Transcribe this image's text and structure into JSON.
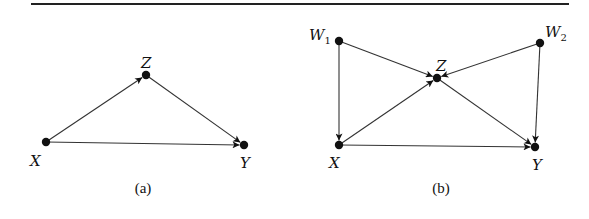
{
  "figure": {
    "rule": {
      "x1": 31,
      "x2": 569,
      "y": 4,
      "color": "#222222"
    },
    "panels": [
      {
        "id": "a",
        "caption": "(a)",
        "caption_pos": [
          143,
          193
        ],
        "nodes": [
          {
            "id": "X",
            "label": "X",
            "sub": "",
            "x": 46,
            "y": 142,
            "lx": 30,
            "ly": 166
          },
          {
            "id": "Z",
            "label": "Z",
            "sub": "",
            "x": 146,
            "y": 75,
            "lx": 141,
            "ly": 68
          },
          {
            "id": "Y",
            "label": "Y",
            "sub": "",
            "x": 244,
            "y": 145,
            "lx": 240,
            "ly": 168
          }
        ],
        "edges": [
          {
            "from": "X",
            "to": "Z"
          },
          {
            "from": "Z",
            "to": "Y"
          },
          {
            "from": "X",
            "to": "Y"
          }
        ]
      },
      {
        "id": "b",
        "caption": "(b)",
        "caption_pos": [
          441,
          193
        ],
        "nodes": [
          {
            "id": "W1",
            "label": "W",
            "sub": "1",
            "x": 339,
            "y": 41,
            "lx": 309,
            "ly": 40
          },
          {
            "id": "W2",
            "label": "W",
            "sub": "2",
            "x": 540,
            "y": 43,
            "lx": 545,
            "ly": 37
          },
          {
            "id": "Z",
            "label": "Z",
            "sub": "",
            "x": 437,
            "y": 78,
            "lx": 436,
            "ly": 71
          },
          {
            "id": "X",
            "label": "X",
            "sub": "",
            "x": 339,
            "y": 145,
            "lx": 329,
            "ly": 168
          },
          {
            "id": "Y",
            "label": "Y",
            "sub": "",
            "x": 535,
            "y": 147,
            "lx": 532,
            "ly": 170
          }
        ],
        "edges": [
          {
            "from": "W1",
            "to": "Z"
          },
          {
            "from": "W2",
            "to": "Z"
          },
          {
            "from": "W1",
            "to": "X"
          },
          {
            "from": "W2",
            "to": "Y"
          },
          {
            "from": "X",
            "to": "Z"
          },
          {
            "from": "Z",
            "to": "Y"
          },
          {
            "from": "X",
            "to": "Y"
          }
        ]
      }
    ]
  }
}
